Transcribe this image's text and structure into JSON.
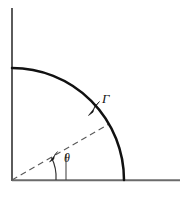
{
  "figure": {
    "kind": "quarter-circle-contour-diagram",
    "background_color": "#ffffff",
    "stroke_color": "#111111",
    "axis_color": "#4a4a4a",
    "dashed_color": "#555555",
    "labels": {
      "contour": "Γ",
      "angle": "θ"
    },
    "axes": {
      "vertical": {
        "x": 12,
        "y_top": 8,
        "y_bottom": 181,
        "width": 1.6
      },
      "horizontal": {
        "y": 180,
        "x_left": 12,
        "x_right": 180,
        "width": 1.6
      }
    },
    "arc": {
      "center_x": 12,
      "center_y": 180,
      "radius": 112,
      "start_angle_deg": 90,
      "end_angle_deg": 0,
      "stroke_width": 2.4,
      "direction_label": "Γ",
      "arrow_angle_deg": 42
    },
    "radius_line": {
      "from_x": 12,
      "from_y": 180,
      "angle_deg": 30,
      "length": 112,
      "dash_pattern": "6 4",
      "stroke_width": 1.1
    },
    "angle_marker": {
      "radius": 44,
      "from_angle_deg": 0,
      "to_angle_deg": 30,
      "stroke_width": 1.1,
      "tick_x": 66,
      "tick_y_top": 155,
      "tick_y_bottom": 180
    }
  }
}
